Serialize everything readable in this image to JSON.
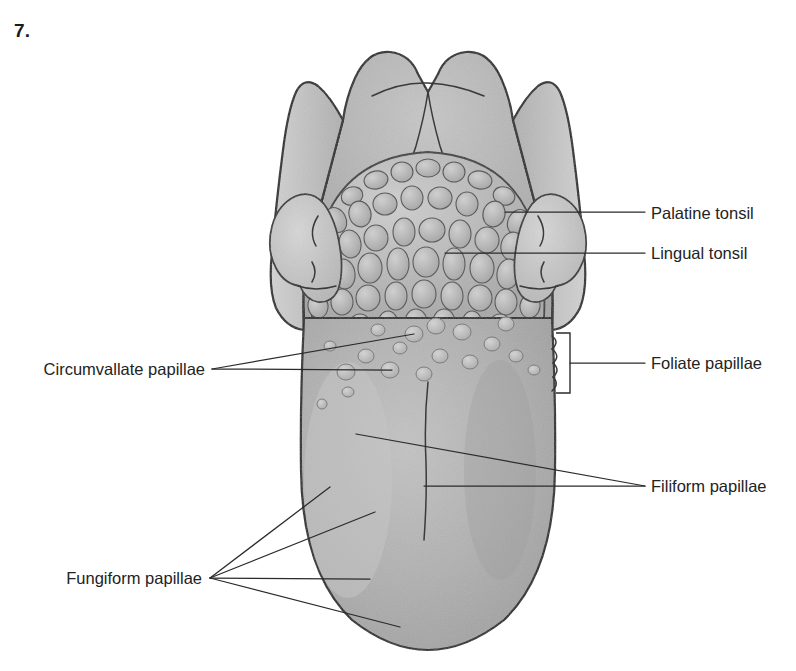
{
  "figure": {
    "number": "7."
  },
  "colors": {
    "background": "#ffffff",
    "outline": "#222222",
    "leader_line": "#2b2b2b",
    "label_text": "#232323",
    "tongue_body": "#ababab",
    "tongue_body_light": "#bfbfbf",
    "epiglottis_light": "#c9c9c9",
    "epiglottis_mid": "#b4b4b4",
    "tonsil_light": "#cacaca",
    "lingual_tonsil_base": "#a6a6a6",
    "nodule_fill": "#bdbdbd",
    "papilla_fill": "#c4c4c4"
  },
  "labels": [
    {
      "id": "palatine-tonsil",
      "text": "Palatine tonsil",
      "text_x": 651,
      "text_y": 219,
      "anchor": "start",
      "leaders": [
        [
          [
            645,
            212
          ],
          [
            505,
            212
          ]
        ]
      ]
    },
    {
      "id": "lingual-tonsil",
      "text": "Lingual tonsil",
      "text_x": 651,
      "text_y": 259,
      "anchor": "start",
      "leaders": [
        [
          [
            645,
            253
          ],
          [
            445,
            253
          ]
        ]
      ]
    },
    {
      "id": "foliate-papillae",
      "text": "Foliate papillae",
      "text_x": 651,
      "text_y": 369,
      "anchor": "start",
      "leaders": [
        [
          [
            645,
            363
          ],
          [
            570,
            363
          ]
        ]
      ],
      "bracket": {
        "x": 570,
        "y_top": 333,
        "y_bottom": 393,
        "arm": 14
      }
    },
    {
      "id": "filiform-papillae",
      "text": "Filiform papillae",
      "text_x": 651,
      "text_y": 492,
      "anchor": "start",
      "leaders": [
        [
          [
            645,
            486
          ],
          [
            356,
            434
          ]
        ],
        [
          [
            645,
            486
          ],
          [
            424,
            486
          ]
        ]
      ]
    },
    {
      "id": "circumvallate-papillae",
      "text": "Circumvallate papillae",
      "text_x": 205,
      "text_y": 375,
      "anchor": "end",
      "leaders": [
        [
          [
            212,
            369
          ],
          [
            414,
            334
          ]
        ],
        [
          [
            212,
            369
          ],
          [
            392,
            370
          ]
        ]
      ]
    },
    {
      "id": "fungiform-papillae",
      "text": "Fungiform papillae",
      "text_x": 202,
      "text_y": 584,
      "anchor": "end",
      "leaders": [
        [
          [
            210,
            578
          ],
          [
            330,
            487
          ]
        ],
        [
          [
            210,
            578
          ],
          [
            375,
            512
          ]
        ],
        [
          [
            210,
            578
          ],
          [
            370,
            579
          ]
        ],
        [
          [
            210,
            578
          ],
          [
            400,
            627
          ]
        ]
      ]
    }
  ],
  "structures": {
    "epiglottis": "epiglottis-with-valleculae",
    "palatine_tonsil_left": "left-palatine-tonsil",
    "palatine_tonsil_right": "right-palatine-tonsil",
    "lingual_tonsil": "lingual-tonsil-nodular-mass",
    "circumvallate_row": "v-shaped-row-of-circumvallate-papillae",
    "median_sulcus": "median-sulcus",
    "tongue_body": "tongue-dorsum-body"
  }
}
